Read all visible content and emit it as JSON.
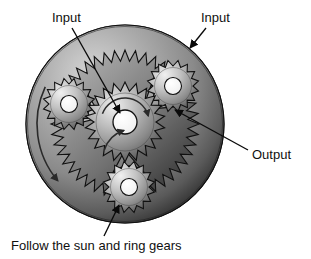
{
  "figure": {
    "title_alt": "Planetary gear set cutaway",
    "background": "#ffffff",
    "width": 311,
    "height": 259
  },
  "labels": {
    "input_left": "Input",
    "input_right": "Input",
    "output": "Output",
    "caption": "Follow the sun and ring gears"
  },
  "annotations": [
    {
      "name": "input-left",
      "text": "Input",
      "text_x": 52,
      "text_y": 22,
      "line": {
        "x1": 72,
        "y1": 28,
        "x2": 120,
        "y2": 113
      },
      "arrow": "end"
    },
    {
      "name": "input-right",
      "text": "Input",
      "text_x": 201,
      "text_y": 22,
      "line": {
        "x1": 206,
        "y1": 28,
        "x2": 190,
        "y2": 48
      },
      "arrow": "end"
    },
    {
      "name": "output",
      "text": "Output",
      "text_x": 252,
      "text_y": 159,
      "line": {
        "x1": 248,
        "y1": 150,
        "x2": 175,
        "y2": 110
      },
      "arrow": "end"
    },
    {
      "name": "caption",
      "text": "Follow the sun and ring gears",
      "text_x": 11,
      "text_y": 250,
      "line": {
        "x1": 104,
        "y1": 236,
        "x2": 119,
        "y2": 205
      },
      "arrow": "end"
    }
  ],
  "gears": {
    "ring": {
      "name": "ring-gear",
      "center": {
        "x": 125,
        "y": 124
      },
      "outer_radius": 99,
      "tooth_root_radius": 74,
      "tooth_tip_radius": 63,
      "teeth": 44,
      "rotation_arrow": {
        "start_angle": 205,
        "end_angle": 140,
        "radius": 88,
        "direction": "ccw"
      }
    },
    "sun": {
      "name": "sun-gear",
      "center": {
        "x": 125,
        "y": 122
      },
      "tip_radius": 40,
      "root_radius": 31,
      "teeth": 22,
      "bore_radius": 12,
      "rotation_arrow": {
        "start_angle": 200,
        "end_angle": 345,
        "radius": 24,
        "direction": "cw"
      }
    },
    "planets": [
      {
        "name": "planet-gear-upper-left",
        "center": {
          "x": 69,
          "y": 104
        },
        "tip_radius": 26,
        "root_radius": 20,
        "teeth": 16,
        "bore_radius": 8.5
      },
      {
        "name": "planet-gear-upper-right",
        "center": {
          "x": 173,
          "y": 86
        },
        "tip_radius": 26,
        "root_radius": 20,
        "teeth": 16,
        "bore_radius": 8.5
      },
      {
        "name": "planet-gear-bottom",
        "center": {
          "x": 129,
          "y": 187
        },
        "tip_radius": 26,
        "root_radius": 20,
        "teeth": 16,
        "bore_radius": 8.5
      }
    ],
    "carrier": {
      "name": "planet-carrier",
      "vertices": [
        {
          "x": 69,
          "y": 104
        },
        {
          "x": 173,
          "y": 86
        },
        {
          "x": 129,
          "y": 187
        }
      ],
      "corner_radius": 21,
      "waist_bulge": 0.74
    }
  },
  "palette": {
    "page_background": "#ffffff",
    "ring_dark": "#2f2f2f",
    "ring_mid": "#7c7c7c",
    "ring_light": "#c9c9c9",
    "gear_body_light": "#e8e8e8",
    "gear_body_mid": "#9a9a9a",
    "gear_body_dark": "#4a4a4a",
    "carrier_light": "#d6d6d6",
    "carrier_dark": "#6b6b6b",
    "outline": "#101010",
    "label_text": "#101010",
    "bore_fill": "#f7f7f7"
  }
}
